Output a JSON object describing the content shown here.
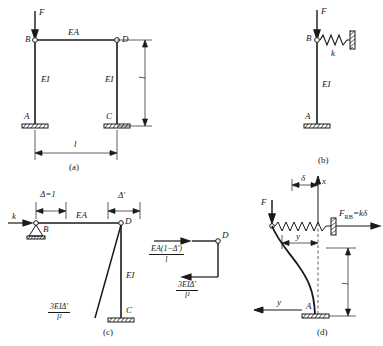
{
  "figure": {
    "type": "structural-engineering-diagram",
    "stroke_color": "#1a1a1a",
    "background": "#ffffff"
  },
  "panels": [
    {
      "id": "a",
      "caption": "(a)",
      "description": "Portal frame ABDC with vertical load F at node B",
      "labels": {
        "force": "F",
        "node_b": "B",
        "node_d": "D",
        "node_a": "A",
        "node_c": "C",
        "beam_stiffness": "EA",
        "left_column_stiffness": "EI",
        "right_column_stiffness": "EI",
        "span_dimension": "l",
        "height_dimension": "l"
      }
    },
    {
      "id": "b",
      "caption": "(b)",
      "description": "Equivalent single column AB with lateral spring k at B",
      "labels": {
        "force": "F",
        "node_b": "B",
        "node_a": "A",
        "spring_constant": "k",
        "column_stiffness": "EI"
      }
    },
    {
      "id": "c",
      "caption": "(c)",
      "description": "Unit displacement analysis giving spring stiffness k",
      "labels": {
        "spring_force": "k",
        "node_b": "B",
        "node_d": "D",
        "node_c": "C",
        "unit_displacement": "Δ=1",
        "delta_prime": "Δ′",
        "beam_stiffness": "EA",
        "column_stiffness": "EI"
      },
      "formulas": {
        "shear_numerator": "3EIΔ′",
        "shear_denominator": "l²"
      }
    },
    {
      "id": "c-fbd",
      "description": "Free body diagram of node D equilibrium",
      "labels": {
        "node_d": "D"
      },
      "formulas": {
        "axial_numerator": "EA(1−Δ′)",
        "axial_denominator": "l",
        "shear_numerator": "3EIΔ′",
        "shear_denominator": "l³"
      }
    },
    {
      "id": "d",
      "caption": "(d)",
      "description": "Buckled column shape with coordinate axes and spring reaction",
      "labels": {
        "force": "F",
        "node_a": "A",
        "tip_deflection": "δ",
        "axis_x": "x",
        "axis_y_inner": "y",
        "axis_y_outer": "y",
        "reaction_name": "F",
        "reaction_sub": "RB",
        "reaction_value": "=kδ",
        "height_dimension": "l"
      }
    }
  ]
}
